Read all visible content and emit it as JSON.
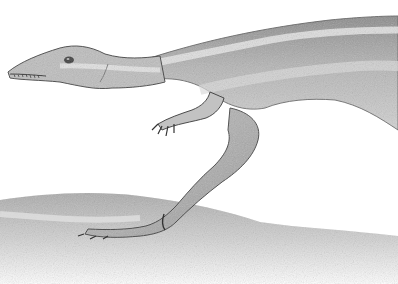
{
  "image": {
    "subject": "dinosaur illustration",
    "style": "grayscale pencil drawing",
    "background": "#ffffff",
    "colors": {
      "body_light": "#c9c9c9",
      "body_mid": "#9a9a9a",
      "body_dark": "#5e5e5e",
      "stripe": "#e2e2e2",
      "ground": "#b8b8b8",
      "outline": "#3a3a3a"
    }
  }
}
